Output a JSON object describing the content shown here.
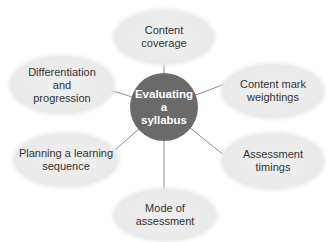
{
  "diagram": {
    "type": "mind-map",
    "center": {
      "label": "Evaluating\na\nsyllabus",
      "color": "#6a6a6a"
    },
    "branches": [
      {
        "label": "Content\ncoverage"
      },
      {
        "label": "Content mark\nweightings"
      },
      {
        "label": "Assessment\ntimings"
      },
      {
        "label": "Mode of\nassessment"
      },
      {
        "label": "Planning a learning\nsequence"
      },
      {
        "label": "Differentiation\nand\nprogression"
      }
    ],
    "node_color": "#ebebeb",
    "line_color": "#8c8c8c"
  }
}
